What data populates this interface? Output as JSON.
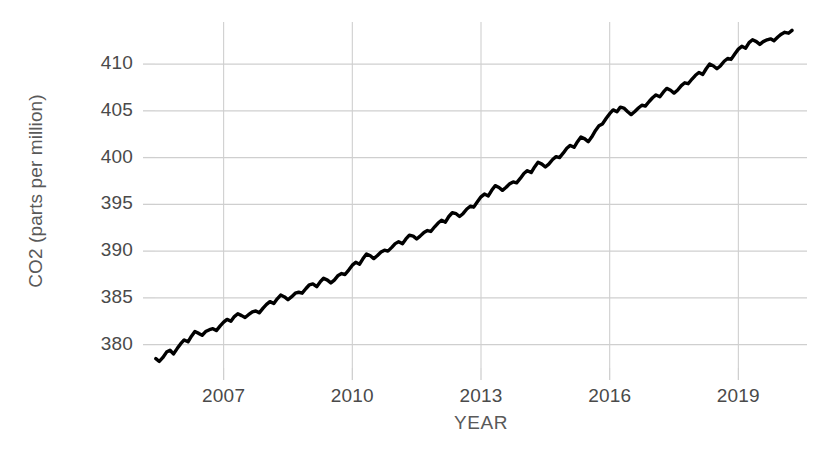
{
  "chart_data": {
    "type": "line",
    "title": "",
    "xlabel": "YEAR",
    "ylabel": "CO2 (parts per million)",
    "xlim": [
      2005.4,
      2020.6
    ],
    "ylim": [
      377.5,
      414.5
    ],
    "xticks": [
      "2007",
      "2010",
      "2013",
      "2016",
      "2019"
    ],
    "xtick_values": [
      2007,
      2010,
      2013,
      2016,
      2019
    ],
    "yticks": [
      "380",
      "385",
      "390",
      "395",
      "400",
      "405",
      "410"
    ],
    "ytick_values": [
      380,
      385,
      390,
      395,
      400,
      405,
      410
    ],
    "grid": true,
    "legend": "none",
    "line_color": "#000000",
    "grid_color": "#cfcfcf",
    "series": [
      {
        "name": "Monthly mean CO2",
        "x": [
          2005.42,
          2005.5,
          2005.58,
          2005.67,
          2005.75,
          2005.83,
          2005.92,
          2006.0,
          2006.08,
          2006.17,
          2006.25,
          2006.33,
          2006.42,
          2006.5,
          2006.58,
          2006.67,
          2006.75,
          2006.83,
          2006.92,
          2007.0,
          2007.08,
          2007.17,
          2007.25,
          2007.33,
          2007.42,
          2007.5,
          2007.58,
          2007.67,
          2007.75,
          2007.83,
          2007.92,
          2008.0,
          2008.08,
          2008.17,
          2008.25,
          2008.33,
          2008.42,
          2008.5,
          2008.58,
          2008.67,
          2008.75,
          2008.83,
          2008.92,
          2009.0,
          2009.08,
          2009.17,
          2009.25,
          2009.33,
          2009.42,
          2009.5,
          2009.58,
          2009.67,
          2009.75,
          2009.83,
          2009.92,
          2010.0,
          2010.08,
          2010.17,
          2010.25,
          2010.33,
          2010.42,
          2010.5,
          2010.58,
          2010.67,
          2010.75,
          2010.83,
          2010.92,
          2011.0,
          2011.08,
          2011.17,
          2011.25,
          2011.33,
          2011.42,
          2011.5,
          2011.58,
          2011.67,
          2011.75,
          2011.83,
          2011.92,
          2012.0,
          2012.08,
          2012.17,
          2012.25,
          2012.33,
          2012.42,
          2012.5,
          2012.58,
          2012.67,
          2012.75,
          2012.83,
          2012.92,
          2013.0,
          2013.08,
          2013.17,
          2013.25,
          2013.33,
          2013.42,
          2013.5,
          2013.58,
          2013.67,
          2013.75,
          2013.83,
          2013.92,
          2014.0,
          2014.08,
          2014.17,
          2014.25,
          2014.33,
          2014.42,
          2014.5,
          2014.58,
          2014.67,
          2014.75,
          2014.83,
          2014.92,
          2015.0,
          2015.08,
          2015.17,
          2015.25,
          2015.33,
          2015.42,
          2015.5,
          2015.58,
          2015.67,
          2015.75,
          2015.83,
          2015.92,
          2016.0,
          2016.08,
          2016.17,
          2016.25,
          2016.33,
          2016.42,
          2016.5,
          2016.58,
          2016.67,
          2016.75,
          2016.83,
          2016.92,
          2017.0,
          2017.08,
          2017.17,
          2017.25,
          2017.33,
          2017.42,
          2017.5,
          2017.58,
          2017.67,
          2017.75,
          2017.83,
          2017.92,
          2018.0,
          2018.08,
          2018.17,
          2018.25,
          2018.33,
          2018.42,
          2018.5,
          2018.58,
          2018.67,
          2018.75,
          2018.83,
          2018.92,
          2019.0,
          2019.08,
          2019.17,
          2019.25,
          2019.33,
          2019.42,
          2019.5,
          2019.58,
          2019.67,
          2019.75,
          2019.83,
          2019.92,
          2020.0,
          2020.08,
          2020.17,
          2020.25
        ],
        "y": [
          378.5,
          378.2,
          378.6,
          379.2,
          379.4,
          379.0,
          379.6,
          380.1,
          380.5,
          380.3,
          380.9,
          381.4,
          381.2,
          381.0,
          381.4,
          381.6,
          381.7,
          381.5,
          382.0,
          382.4,
          382.7,
          382.5,
          383.0,
          383.3,
          383.1,
          382.9,
          383.2,
          383.5,
          383.6,
          383.4,
          383.9,
          384.3,
          384.6,
          384.4,
          384.9,
          385.3,
          385.1,
          384.8,
          385.1,
          385.5,
          385.6,
          385.5,
          386.0,
          386.4,
          386.5,
          386.2,
          386.7,
          387.1,
          386.9,
          386.6,
          386.9,
          387.4,
          387.6,
          387.5,
          388.0,
          388.5,
          388.8,
          388.6,
          389.2,
          389.7,
          389.5,
          389.2,
          389.5,
          389.9,
          390.1,
          390.0,
          390.4,
          390.8,
          391.0,
          390.8,
          391.3,
          391.7,
          391.6,
          391.3,
          391.6,
          392.0,
          392.2,
          392.1,
          392.6,
          393.0,
          393.3,
          393.1,
          393.7,
          394.1,
          394.0,
          393.7,
          394.0,
          394.5,
          394.8,
          394.7,
          395.3,
          395.8,
          396.1,
          395.9,
          396.5,
          397.0,
          396.8,
          396.5,
          396.8,
          397.2,
          397.4,
          397.3,
          397.8,
          398.3,
          398.6,
          398.4,
          399.0,
          399.5,
          399.3,
          399.0,
          399.3,
          399.8,
          400.1,
          400.0,
          400.5,
          401.0,
          401.3,
          401.1,
          401.7,
          402.2,
          402.0,
          401.7,
          402.2,
          402.9,
          403.4,
          403.6,
          404.2,
          404.7,
          405.1,
          404.9,
          405.4,
          405.3,
          404.9,
          404.6,
          404.9,
          405.3,
          405.6,
          405.5,
          406.0,
          406.4,
          406.7,
          406.5,
          407.0,
          407.4,
          407.2,
          406.9,
          407.2,
          407.7,
          408.0,
          407.9,
          408.4,
          408.8,
          409.1,
          408.9,
          409.5,
          410.0,
          409.8,
          409.5,
          409.8,
          410.3,
          410.6,
          410.5,
          411.1,
          411.6,
          411.9,
          411.7,
          412.3,
          412.6,
          412.4,
          412.1,
          412.4,
          412.6,
          412.7,
          412.5,
          412.9,
          413.2,
          413.4,
          413.3,
          413.6
        ]
      }
    ]
  },
  "axis": {
    "ylabel_text": "CO2 (parts per million)",
    "xlabel_text": "YEAR"
  }
}
